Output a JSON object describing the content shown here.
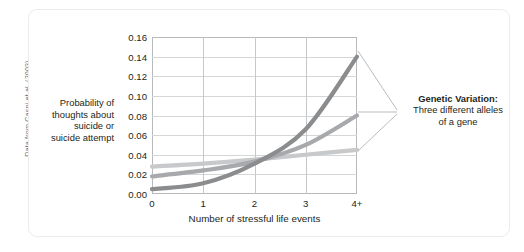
{
  "credit": "Data from Caspi et al. (2003)",
  "callout": {
    "heading": "Genetic Variation:",
    "line2": "Three different alleles",
    "line3": "of a gene"
  },
  "colors": {
    "series_dark": "#8a8c8e",
    "series_mid": "#a7a9ac",
    "series_light": "#c7c9cb",
    "grid": "#d4d6d8",
    "frame": "#b7b9bb",
    "text": "#231f20",
    "card_border": "#ececed"
  },
  "chart_data": {
    "type": "line",
    "title": "",
    "xlabel": "Number of stressful life events",
    "ylabel": "Probability of thoughts about suicide or suicide attempt",
    "ylabel_lines": [
      "Probability of",
      "thoughts about",
      "suicide or",
      "suicide attempt"
    ],
    "categories": [
      "0",
      "1",
      "2",
      "3",
      "4+"
    ],
    "x": [
      0,
      1,
      2,
      3,
      4
    ],
    "xlim": [
      0,
      4
    ],
    "ylim": [
      0.0,
      0.16
    ],
    "yticks": [
      "0.00",
      "0.02",
      "0.04",
      "0.06",
      "0.08",
      "0.10",
      "0.12",
      "0.14",
      "0.16"
    ],
    "ytick_values": [
      0.0,
      0.02,
      0.04,
      0.06,
      0.08,
      0.1,
      0.12,
      0.14,
      0.16
    ],
    "xticks": [
      "0",
      "1",
      "2",
      "3",
      "4+"
    ],
    "grid": true,
    "legend": "none",
    "series": [
      {
        "name": "allele-dark",
        "color": "#8a8c8e",
        "values": [
          0.005,
          0.011,
          0.031,
          0.066,
          0.14
        ]
      },
      {
        "name": "allele-mid",
        "color": "#a7a9ac",
        "values": [
          0.018,
          0.024,
          0.033,
          0.05,
          0.08
        ]
      },
      {
        "name": "allele-light",
        "color": "#c7c9cb",
        "values": [
          0.028,
          0.031,
          0.035,
          0.04,
          0.045
        ]
      }
    ],
    "annotations": [
      {
        "text": "Genetic Variation: Three different alleles of a gene",
        "points_to": [
          "allele-dark",
          "allele-mid",
          "allele-light"
        ]
      }
    ]
  }
}
